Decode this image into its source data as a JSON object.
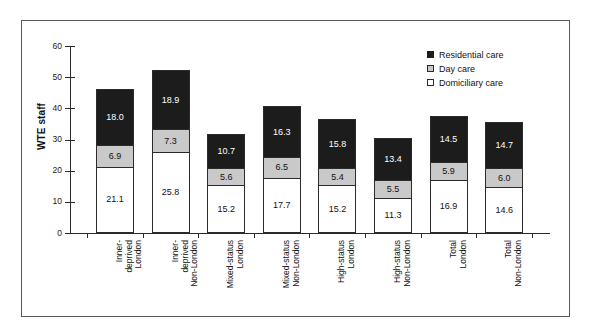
{
  "chart_data": {
    "type": "bar",
    "subtype": "stacked-bar",
    "title": "",
    "xlabel": "",
    "ylabel": "WTE staff",
    "ylim": [
      0,
      60
    ],
    "yticks": [
      0,
      10,
      20,
      30,
      40,
      50,
      60
    ],
    "grid": false,
    "legend_position": "top-right",
    "categories": [
      "Inner-deprived London",
      "Inner-deprived Non-London",
      "Mixed-status London",
      "Mixed-status Non-London",
      "High-status London",
      "High-status Non-London",
      "Total London",
      "Total Non-London"
    ],
    "category_lines": [
      "Inner-\ndeprived\nLondon",
      "Inner-\ndeprived\nNon-London",
      "Mixed-status\nLondon",
      "Mixed-status\nNon-London",
      "High-status\nLondon",
      "High-status\nNon-London",
      "Total\nLondon",
      "Total\nNon-London"
    ],
    "series": [
      {
        "name": "Domiciliary care",
        "color": "#ffffff",
        "values": [
          21.1,
          25.8,
          15.2,
          17.7,
          15.2,
          11.3,
          16.9,
          14.6
        ],
        "labels": [
          "21.1",
          "25.8",
          "15.2",
          "17.7",
          "15.2",
          "11.3",
          "16.9",
          "14.6"
        ]
      },
      {
        "name": "Day care",
        "color": "#c9c9c9",
        "values": [
          6.9,
          7.3,
          5.6,
          6.5,
          5.4,
          5.5,
          5.9,
          6.0
        ],
        "labels": [
          "6.9",
          "7.3",
          "5.6",
          "6.5",
          "5.4",
          "5.5",
          "5.9",
          "6.0"
        ]
      },
      {
        "name": "Residential care",
        "color": "#1c1c1c",
        "values": [
          18.0,
          18.9,
          10.7,
          16.3,
          15.8,
          13.4,
          14.5,
          14.7
        ],
        "labels": [
          "18.0",
          "18.9",
          "10.7",
          "16.3",
          "15.8",
          "13.4",
          "14.5",
          "14.7"
        ]
      }
    ],
    "totals": [
      46.0,
      52.0,
      31.5,
      40.5,
      36.4,
      30.2,
      37.3,
      35.3
    ]
  },
  "legend": {
    "items": [
      {
        "label": "Residential care",
        "swatch": "black-square-icon"
      },
      {
        "label": "Day care",
        "swatch": "gray-square-icon"
      },
      {
        "label": "Domiciliary care",
        "swatch": "white-square-icon"
      }
    ]
  },
  "axis": {
    "y_title": "WTE staff",
    "y_labels": [
      "60",
      "50",
      "40",
      "30",
      "20",
      "10",
      "0"
    ]
  }
}
